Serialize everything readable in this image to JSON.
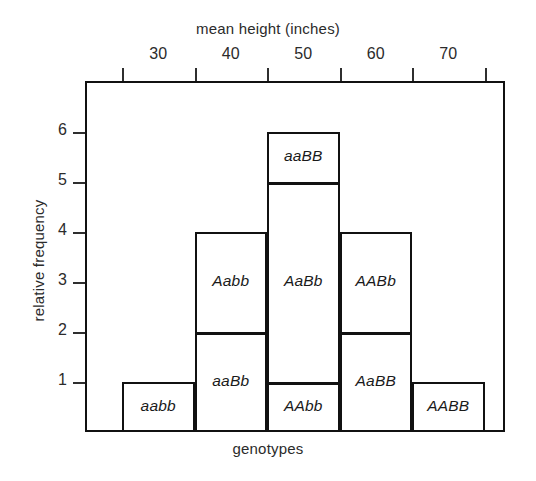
{
  "chart_data": {
    "type": "bar",
    "title": "",
    "xlabel": "genotypes",
    "xlabel_top": "mean height (inches)",
    "ylabel": "relative frequency",
    "ylim": [
      0,
      7
    ],
    "xlim": [
      25,
      75
    ],
    "grid": false,
    "legend": "none",
    "x_tick_labels": [
      "30",
      "40",
      "50",
      "60",
      "70"
    ],
    "x_tick_values": [
      30,
      40,
      50,
      60,
      70
    ],
    "y_tick_labels": [
      "1",
      "2",
      "3",
      "4",
      "5",
      "6"
    ],
    "y_tick_values": [
      1,
      2,
      3,
      4,
      5,
      6
    ],
    "categories": [
      "30",
      "40",
      "50",
      "60",
      "70"
    ],
    "values": [
      1,
      4,
      6,
      4,
      1
    ],
    "bars": [
      {
        "category": "30",
        "center": 30,
        "total": 1,
        "segments": [
          {
            "label": "aabb",
            "from": 0,
            "to": 1
          }
        ]
      },
      {
        "category": "40",
        "center": 40,
        "total": 4,
        "segments": [
          {
            "label": "aaBb",
            "from": 0,
            "to": 2
          },
          {
            "label": "Aabb",
            "from": 2,
            "to": 4
          }
        ]
      },
      {
        "category": "50",
        "center": 50,
        "total": 6,
        "segments": [
          {
            "label": "AAbb",
            "from": 0,
            "to": 1
          },
          {
            "label": "AaBb",
            "from": 1,
            "to": 5
          },
          {
            "label": "aaBB",
            "from": 5,
            "to": 6
          }
        ]
      },
      {
        "category": "60",
        "center": 60,
        "total": 4,
        "segments": [
          {
            "label": "AaBB",
            "from": 0,
            "to": 2
          },
          {
            "label": "AABb",
            "from": 2,
            "to": 4
          }
        ]
      },
      {
        "category": "70",
        "center": 70,
        "total": 1,
        "segments": [
          {
            "label": "AABB",
            "from": 0,
            "to": 1
          }
        ]
      }
    ],
    "colors": {
      "line": "#111111",
      "fill": "#ffffff",
      "text": "#1a1a1a",
      "background": "#ffffff"
    }
  }
}
